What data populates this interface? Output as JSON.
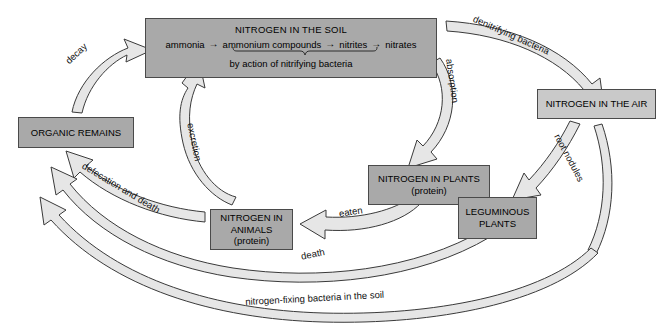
{
  "diagram": {
    "colors": {
      "box_fill": "#a9a9a9",
      "box_fill_light": "#c9c9c9",
      "box_border": "#4a4a4a",
      "arrow_fill": "#e4e4e4",
      "arrow_stroke": "#3b3b3b",
      "background": "#ffffff",
      "text": "#000000"
    },
    "nodes": [
      {
        "id": "soil",
        "title": "NITROGEN IN THE SOIL",
        "chain": [
          "ammonia",
          "ammonium compounds",
          "nitrites",
          "nitrates"
        ],
        "chain_arrow": "→",
        "footer": "by action of nitrifying bacteria",
        "brace_note": "brace spans ammonium compounds through nitrates"
      },
      {
        "id": "organic",
        "label": "ORGANIC REMAINS"
      },
      {
        "id": "air",
        "label": "NITROGEN IN THE AIR"
      },
      {
        "id": "plants",
        "line1": "NITROGEN IN PLANTS",
        "line2": "(protein)"
      },
      {
        "id": "legume",
        "line1": "LEGUMINOUS",
        "line2": "PLANTS"
      },
      {
        "id": "animals",
        "line1": "NITROGEN IN",
        "line2": "ANIMALS",
        "line3": "(protein)"
      }
    ],
    "edges": [
      {
        "id": "decay",
        "label": "decay",
        "from": "organic",
        "to": "soil"
      },
      {
        "id": "denitrifying",
        "label": "denitrifying bacteria",
        "from": "soil",
        "to": "air"
      },
      {
        "id": "absorption",
        "label": "absorption",
        "from": "soil",
        "to": "plants"
      },
      {
        "id": "root-nodules",
        "label": "root nodules",
        "from": "air",
        "to": "legume"
      },
      {
        "id": "eaten",
        "label": "eaten",
        "from": "plants",
        "to": "animals"
      },
      {
        "id": "excretion",
        "label": "excretion",
        "from": "animals",
        "to": "soil"
      },
      {
        "id": "defecation",
        "label": "defecation and death",
        "from": "animals",
        "to": "organic"
      },
      {
        "id": "death",
        "label": "death",
        "from": "animals",
        "to": "organic"
      },
      {
        "id": "nitrogen-fixing",
        "label": "nitrogen-fixing bacteria in the soil",
        "from": "air",
        "to": "organic"
      }
    ]
  }
}
